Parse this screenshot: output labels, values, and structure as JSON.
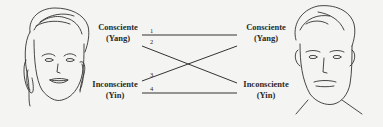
{
  "left": {
    "top_label": "Consciente",
    "top_sub": "(Yang)",
    "bottom_label": "Inconsciente",
    "bottom_sub": "(Yin)"
  },
  "right": {
    "top_label": "Consciente",
    "top_sub": "(Yang)",
    "bottom_label": "Inconsciente",
    "bottom_sub": "(Yin)"
  },
  "lines": [
    {
      "number": "1",
      "from": "Consciente (Yang)",
      "to": "Consciente (Yang)"
    },
    {
      "number": "2",
      "from": "Consciente (Yang)",
      "to": "Inconsciente (Yin)"
    },
    {
      "number": "3",
      "from": "Inconsciente (Yin)",
      "to": "Consciente (Yang)"
    },
    {
      "number": "4",
      "from": "Inconsciente (Yin)",
      "to": "Inconsciente (Yin)"
    }
  ]
}
